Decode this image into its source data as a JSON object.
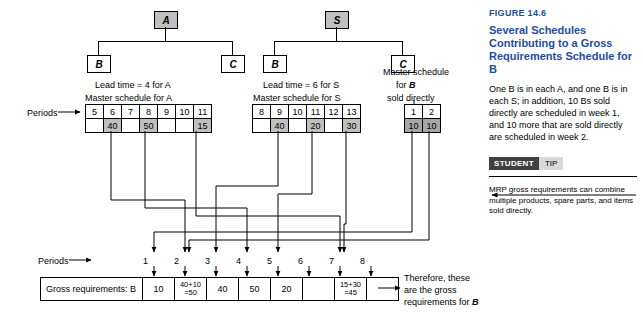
{
  "figure": {
    "label": "FIGURE 14.6",
    "title": "Several Schedules Contributing to a Gross Requirements Schedule for B",
    "body": "One B is in each A, and one B is in each S; in addition, 10 Bs sold directly are scheduled in week 1, and 10 more that are sold directly are scheduled in week 2.",
    "student_tag": "STUDENT",
    "tip_tag": "TIP",
    "tip_text": "MRP gross requirements can combine multiple products, spare parts, and items sold directly."
  },
  "trees": {
    "a": {
      "parent": "A",
      "child_left": "B",
      "child_right": "C"
    },
    "s": {
      "parent": "S",
      "child_left": "B",
      "child_right": "C"
    }
  },
  "captions": {
    "lead_a": "Lead time = 4 for A",
    "master_a": "Master schedule for A",
    "lead_s": "Lead time = 6 for S",
    "master_s": "Master schedule for S",
    "master_b_line1": "Master schedule",
    "master_b_line2": "for",
    "master_b_italic": "B",
    "master_b_line3": "sold directly",
    "periods_top": "Periods",
    "periods_bottom": "Periods",
    "arrow": "→",
    "conclusion_line1": "Therefore, these",
    "conclusion_line2": "are the gross",
    "conclusion_line3": "requirements for",
    "conclusion_italic": "B"
  },
  "schedule_a": {
    "periods": [
      "5",
      "6",
      "7",
      "8",
      "9",
      "10",
      "11"
    ],
    "values": [
      "",
      "40",
      "",
      "50",
      "",
      "",
      "15"
    ],
    "shaded": [
      false,
      true,
      false,
      true,
      false,
      false,
      true
    ]
  },
  "schedule_s": {
    "periods": [
      "8",
      "9",
      "10",
      "11",
      "12",
      "13"
    ],
    "values": [
      "",
      "40",
      "",
      "20",
      "",
      "30"
    ],
    "shaded": [
      false,
      true,
      false,
      true,
      false,
      true
    ]
  },
  "schedule_b": {
    "periods": [
      "1",
      "2"
    ],
    "values": [
      "10",
      "10"
    ],
    "shaded": [
      true,
      true
    ]
  },
  "gross": {
    "row_label": "Gross requirements: B",
    "periods": [
      "1",
      "2",
      "3",
      "4",
      "5",
      "6",
      "7",
      "8"
    ],
    "values": [
      "10",
      "40+10\n=50",
      "40",
      "50",
      "20",
      "",
      "15+30\n=45",
      ""
    ]
  }
}
